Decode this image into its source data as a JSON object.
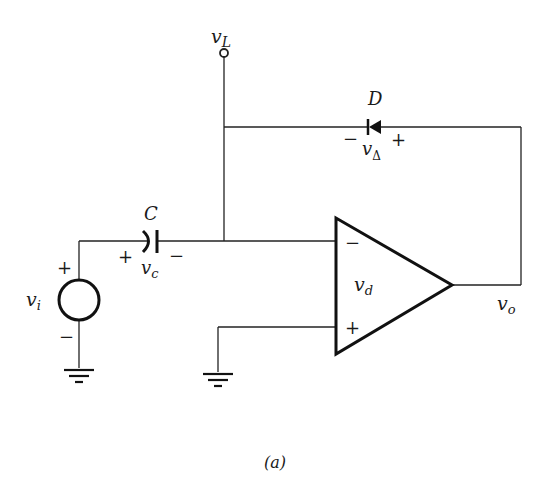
{
  "diagram": {
    "caption": "(a)",
    "colors": {
      "line": "#222222",
      "background": "#ffffff"
    },
    "nodes": {
      "load_terminal": {
        "label": "v",
        "sub": "L"
      },
      "output": {
        "label": "v",
        "sub": "o"
      }
    },
    "components": {
      "diode": {
        "name": "D",
        "voltage_label": "v",
        "voltage_sub": "Δ",
        "minus": "−",
        "plus": "+"
      },
      "capacitor": {
        "name": "C",
        "voltage_label": "v",
        "voltage_sub": "c",
        "plus": "+",
        "minus": "−"
      },
      "source": {
        "label": "v",
        "sub": "i",
        "plus": "+",
        "minus": "−"
      },
      "opamp": {
        "label": "v",
        "sub": "d",
        "inverting": "−",
        "noninverting": "+"
      }
    }
  }
}
